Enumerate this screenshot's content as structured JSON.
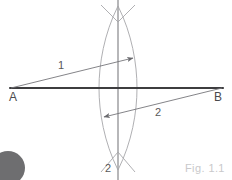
{
  "figure": {
    "caption": "Fig. 1.1",
    "labels": {
      "point_a": "A",
      "point_b": "B",
      "ray_one": "1",
      "ray_two": "2",
      "axis_two": "2"
    },
    "colors": {
      "baseline": "#3d3d3f",
      "construction_arc": "#b0b0b3",
      "perpendicular": "#a5a5a8",
      "ray": "#76767a",
      "label_text": "#58585a",
      "endpoint_text": "#4a4a4c",
      "caption_text": "#c9c9cb",
      "corner_blob": "#6e6e70",
      "background": "#ffffff"
    },
    "geometry": {
      "baseline": {
        "x1": 10,
        "y1": 88,
        "x2": 223,
        "y2": 88
      },
      "perpendicular": {
        "x": 118,
        "y1": 0,
        "y2": 180
      },
      "arc_left_center_x": 155,
      "arc_right_center_x": 81,
      "arc_top_cross": {
        "x": 118,
        "y": 22
      },
      "arc_bottom_cross": {
        "x": 118,
        "y": 152
      },
      "lens_half_width": 19,
      "ray_one": {
        "x1": 11,
        "y1": 88,
        "x2": 133,
        "y2": 58
      },
      "ray_two": {
        "x1": 104,
        "y1": 117,
        "x2": 222,
        "y2": 88
      },
      "corner_blob": {
        "cx": 8,
        "cy": 168,
        "r": 17
      }
    }
  }
}
